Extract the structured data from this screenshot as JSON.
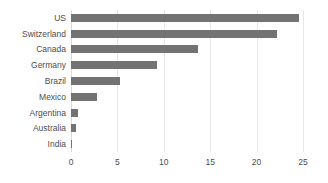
{
  "chart_data": {
    "type": "bar",
    "orientation": "horizontal",
    "title": "",
    "subtitle": "",
    "xlabel": "",
    "ylabel": "",
    "categories": [
      "US",
      "Switzerland",
      "Canada",
      "Germany",
      "Brazil",
      "Mexico",
      "Argentina",
      "Australia",
      "India"
    ],
    "values": [
      24.6,
      22.2,
      13.7,
      9.3,
      5.3,
      2.8,
      0.8,
      0.5,
      0.15
    ],
    "xlim": [
      0,
      25
    ],
    "xticks": [
      0,
      5,
      10,
      15,
      20,
      25
    ],
    "xtick_labels": [
      "0",
      "5",
      "10",
      "15",
      "20",
      "25"
    ],
    "grid": true,
    "grid_axis": "x",
    "legend": false,
    "legend_position": "none",
    "bar_color": "#737373",
    "grid_color": "#e8e8e8",
    "text_color": "#4d4d4d",
    "background_color": "#ffffff"
  }
}
